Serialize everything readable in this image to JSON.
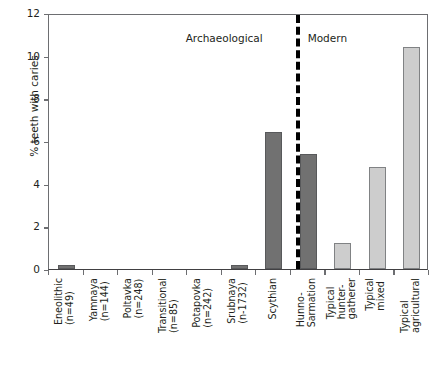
{
  "chart_data": {
    "type": "bar",
    "title": "",
    "xlabel": "",
    "ylabel": "% teeth with caries",
    "ylim": [
      0,
      12
    ],
    "yticks": [
      0,
      2,
      4,
      6,
      8,
      10,
      12
    ],
    "grid": false,
    "legend": "none",
    "categories": [
      "Eneolithic\n(n=49)",
      "Yamnaya\n(n=144)",
      "Poltavka\n(n=248)",
      "Transitional\n(n=85)",
      "Potapovka\n(n=242)",
      "Srubnaya\n(n-1732)",
      "Scythian",
      "Hunno-\nSarmation",
      "Typical\nhunter-\ngatherer",
      "Typical\nmixed",
      "Typical\nagricultural"
    ],
    "values": [
      0.2,
      0.0,
      0.0,
      0.0,
      0.0,
      0.2,
      6.4,
      5.4,
      1.2,
      4.8,
      10.4
    ],
    "groups": [
      "Archaeological",
      "Modern"
    ],
    "group_split_after_index": 7,
    "annotations": [
      "Archaeological",
      "Modern"
    ],
    "series_colors": {
      "archaeological": "#717171",
      "modern": "#cdcdcd"
    }
  },
  "axis": {
    "y_title": "% teeth with caries",
    "y_tick_labels": [
      "12",
      "10",
      "8",
      "6",
      "4",
      "2",
      "0"
    ]
  },
  "groups": {
    "archaeological_label": "Archaeological",
    "modern_label": "Modern"
  },
  "bars": [
    {
      "label_line1": "Eneolithic",
      "label_line2": "(n=49)",
      "value": 0.2,
      "style": "dark"
    },
    {
      "label_line1": "Yamnaya",
      "label_line2": "(n=144)",
      "value": 0.0,
      "style": "dark"
    },
    {
      "label_line1": "Poltavka",
      "label_line2": "(n=248)",
      "value": 0.0,
      "style": "dark"
    },
    {
      "label_line1": "Transitional",
      "label_line2": "(n=85)",
      "value": 0.0,
      "style": "dark"
    },
    {
      "label_line1": "Potapovka",
      "label_line2": "(n=242)",
      "value": 0.0,
      "style": "dark"
    },
    {
      "label_line1": "Srubnaya",
      "label_line2": "(n-1732)",
      "value": 0.2,
      "style": "dark"
    },
    {
      "label_line1": "Scythian",
      "label_line2": "",
      "value": 6.4,
      "style": "dark"
    },
    {
      "label_line1": "Hunno-",
      "label_line2": "Sarmation",
      "value": 5.4,
      "style": "dark"
    },
    {
      "label_line1": "Typical",
      "label_line2": "hunter-",
      "label_line3": "gatherer",
      "value": 1.2,
      "style": "light"
    },
    {
      "label_line1": "Typical",
      "label_line2": "mixed",
      "value": 4.8,
      "style": "light"
    },
    {
      "label_line1": "Typical",
      "label_line2": "agricultural",
      "value": 10.4,
      "style": "light"
    }
  ]
}
